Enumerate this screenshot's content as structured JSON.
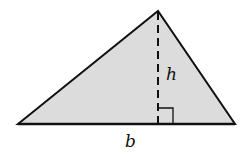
{
  "diagram": {
    "type": "triangle-area",
    "shape": "triangle",
    "vertices": {
      "left": [
        18,
        124
      ],
      "apex": [
        158,
        11
      ],
      "right": [
        235,
        124
      ]
    },
    "fill_color": "#dcdcdc",
    "stroke_color": "#111111",
    "height_line": {
      "style": "dashed",
      "x": 158,
      "y_top": 11,
      "y_bottom": 124
    },
    "right_angle_marker": {
      "x": 158,
      "y": 108,
      "size": 15
    },
    "labels": {
      "height": "h",
      "base": "b"
    }
  }
}
